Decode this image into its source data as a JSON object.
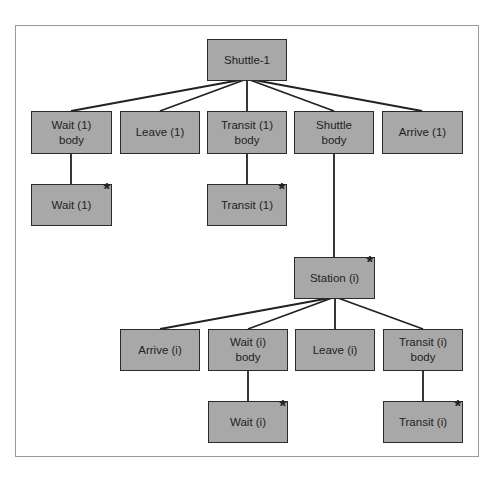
{
  "diagram": {
    "type": "tree",
    "colors": {
      "node_fill": "#a8a8a8",
      "node_border": "#2a2a2a",
      "line": "#222222",
      "frame": "#9a9a9a"
    },
    "nodes": {
      "shuttle1": {
        "label": "Shuttle-1",
        "repeat": false
      },
      "wait1_body": {
        "label": "Wait (1)\nbody",
        "repeat": false
      },
      "leave1": {
        "label": "Leave (1)",
        "repeat": false
      },
      "transit1_body": {
        "label": "Transit (1)\nbody",
        "repeat": false
      },
      "shuttle_body": {
        "label": "Shuttle\nbody",
        "repeat": false
      },
      "arrive1": {
        "label": "Arrive (1)",
        "repeat": false
      },
      "wait1": {
        "label": "Wait (1)",
        "repeat": true,
        "marker": "*"
      },
      "transit1": {
        "label": "Transit (1)",
        "repeat": true,
        "marker": "*"
      },
      "station_i": {
        "label": "Station (i)",
        "repeat": true,
        "marker": "*"
      },
      "arrive_i": {
        "label": "Arrive (i)",
        "repeat": false
      },
      "wait_i_body": {
        "label": "Wait (i)\nbody",
        "repeat": false
      },
      "leave_i": {
        "label": "Leave (i)",
        "repeat": false
      },
      "transit_i_body": {
        "label": "Transit (i)\nbody",
        "repeat": false
      },
      "wait_i": {
        "label": "Wait (i)",
        "repeat": true,
        "marker": "*"
      },
      "transit_i": {
        "label": "Transit (i)",
        "repeat": true,
        "marker": "*"
      }
    },
    "edges": [
      [
        "Shuttle-1",
        "Wait (1) body"
      ],
      [
        "Shuttle-1",
        "Leave (1)"
      ],
      [
        "Shuttle-1",
        "Transit (1) body"
      ],
      [
        "Shuttle-1",
        "Shuttle body"
      ],
      [
        "Shuttle-1",
        "Arrive (1)"
      ],
      [
        "Wait (1) body",
        "Wait (1)"
      ],
      [
        "Transit (1) body",
        "Transit (1)"
      ],
      [
        "Shuttle body",
        "Station (i)"
      ],
      [
        "Station (i)",
        "Arrive (i)"
      ],
      [
        "Station (i)",
        "Wait (i) body"
      ],
      [
        "Station (i)",
        "Leave (i)"
      ],
      [
        "Station (i)",
        "Transit (i) body"
      ],
      [
        "Wait (i) body",
        "Wait (i)"
      ],
      [
        "Transit (i) body",
        "Transit (i)"
      ]
    ]
  }
}
